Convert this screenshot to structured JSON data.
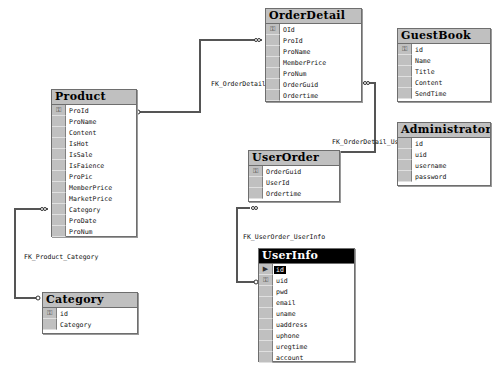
{
  "diagram": {
    "tables": {
      "orderdetail": {
        "title": "OrderDetail",
        "fields": [
          {
            "name": "OId",
            "key": true
          },
          {
            "name": "ProId"
          },
          {
            "name": "ProName"
          },
          {
            "name": "MemberPrice"
          },
          {
            "name": "ProNum"
          },
          {
            "name": "OrderGuid"
          },
          {
            "name": "Ordertime"
          }
        ]
      },
      "guestbook": {
        "title": "GuestBook",
        "fields": [
          {
            "name": "id",
            "key": true
          },
          {
            "name": "Name"
          },
          {
            "name": "Title"
          },
          {
            "name": "Content"
          },
          {
            "name": "SendTime"
          }
        ]
      },
      "product": {
        "title": "Product",
        "fields": [
          {
            "name": "ProId",
            "key": true
          },
          {
            "name": "ProName"
          },
          {
            "name": "Content"
          },
          {
            "name": "IsHot"
          },
          {
            "name": "IsSale"
          },
          {
            "name": "IsFaience"
          },
          {
            "name": "ProPic"
          },
          {
            "name": "MemberPrice"
          },
          {
            "name": "MarketPrice"
          },
          {
            "name": "Category"
          },
          {
            "name": "ProDate"
          },
          {
            "name": "ProNum"
          }
        ]
      },
      "administrator": {
        "title": "Administrator",
        "fields": [
          {
            "name": "id"
          },
          {
            "name": "uid"
          },
          {
            "name": "username"
          },
          {
            "name": "password"
          }
        ]
      },
      "userorder": {
        "title": "UserOrder",
        "fields": [
          {
            "name": "OrderGuid",
            "key": true
          },
          {
            "name": "UserId"
          },
          {
            "name": "Ordertime"
          }
        ]
      },
      "userinfo": {
        "title": "UserInfo",
        "selected": true,
        "fields": [
          {
            "name": "id",
            "current": true
          },
          {
            "name": "uid",
            "key": true
          },
          {
            "name": "pwd"
          },
          {
            "name": "email"
          },
          {
            "name": "uname"
          },
          {
            "name": "uaddress"
          },
          {
            "name": "uphone"
          },
          {
            "name": "uregtime"
          },
          {
            "name": "account"
          }
        ]
      },
      "category": {
        "title": "Category",
        "fields": [
          {
            "name": "id",
            "key": true
          },
          {
            "name": "Category"
          }
        ]
      }
    },
    "relationships": {
      "fk_orderdetail_product": "FK_OrderDetail_",
      "fk_orderdetail_userorder": "FK_OrderDetail_Use",
      "fk_userorder_userinfo": "FK_UserOrder_UserInfo",
      "fk_product_category": "FK_Product_Category"
    },
    "icons": {
      "key": "key-icon",
      "row_pointer": "row-pointer-icon"
    },
    "colors": {
      "title_bar": "#c0c0c0",
      "selected_title_bar": "#000000",
      "line": "#555555"
    }
  }
}
